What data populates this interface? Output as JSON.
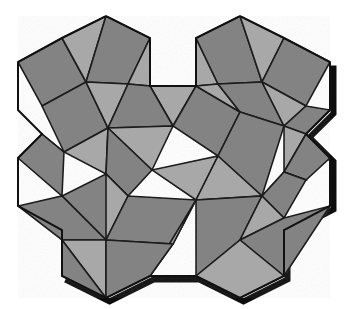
{
  "figure": {
    "artifact_glyph": "g",
    "canvas": {
      "width": 348,
      "height": 309
    }
  },
  "palette": {
    "background": "#ffffff",
    "dark_fill": "#838383",
    "light_fill": "#a8a8a8",
    "stroke": "#1c1c1c",
    "shadow": "#0d0d0d",
    "outline": "#111111"
  },
  "geometry": {
    "stroke_width": 1.6,
    "outline_width": 2.0,
    "shadow_width": 6.0,
    "silhouette": [
      [
        62,
        38
      ],
      [
        106,
        16
      ],
      [
        150,
        38
      ],
      [
        150,
        86
      ],
      [
        196,
        86
      ],
      [
        196,
        38
      ],
      [
        240,
        16
      ],
      [
        284,
        38
      ],
      [
        330,
        62
      ],
      [
        330,
        110
      ],
      [
        306,
        134
      ],
      [
        330,
        158
      ],
      [
        330,
        206
      ],
      [
        284,
        230
      ],
      [
        284,
        276
      ],
      [
        240,
        298
      ],
      [
        196,
        276
      ],
      [
        150,
        276
      ],
      [
        106,
        298
      ],
      [
        62,
        276
      ],
      [
        62,
        230
      ],
      [
        18,
        206
      ],
      [
        18,
        158
      ],
      [
        42,
        134
      ],
      [
        18,
        110
      ],
      [
        18,
        62
      ]
    ],
    "shadow_path": [
      [
        330,
        62
      ],
      [
        330,
        110
      ],
      [
        306,
        134
      ],
      [
        330,
        158
      ],
      [
        330,
        206
      ],
      [
        284,
        230
      ],
      [
        284,
        276
      ],
      [
        240,
        298
      ],
      [
        196,
        276
      ],
      [
        150,
        276
      ],
      [
        106,
        298
      ],
      [
        62,
        276
      ]
    ],
    "faces": [
      {
        "id": "sq-tl-outer",
        "kind": "square",
        "shade": "dark",
        "points": [
          [
            18,
            62
          ],
          [
            62,
            38
          ],
          [
            86,
            82
          ],
          [
            42,
            106
          ]
        ]
      },
      {
        "id": "tri-tl-top",
        "kind": "triangle",
        "shade": "light",
        "points": [
          [
            62,
            38
          ],
          [
            106,
            16
          ],
          [
            86,
            82
          ]
        ]
      },
      {
        "id": "sq-tl-top",
        "kind": "square",
        "shade": "dark",
        "points": [
          [
            106,
            16
          ],
          [
            150,
            38
          ],
          [
            128,
            84
          ],
          [
            86,
            82
          ]
        ]
      },
      {
        "id": "tri-tl-right",
        "kind": "triangle",
        "shade": "light",
        "points": [
          [
            150,
            38
          ],
          [
            150,
            86
          ],
          [
            128,
            84
          ]
        ]
      },
      {
        "id": "tri-top-notch",
        "kind": "triangle",
        "shade": "light",
        "points": [
          [
            150,
            86
          ],
          [
            196,
            86
          ],
          [
            173,
            126
          ]
        ]
      },
      {
        "id": "tri-tr-left",
        "kind": "triangle",
        "shade": "light",
        "points": [
          [
            196,
            86
          ],
          [
            196,
            38
          ],
          [
            218,
            84
          ]
        ]
      },
      {
        "id": "sq-tr-top",
        "kind": "square",
        "shade": "dark",
        "points": [
          [
            196,
            38
          ],
          [
            240,
            16
          ],
          [
            262,
            82
          ],
          [
            218,
            84
          ]
        ]
      },
      {
        "id": "tri-tr-top",
        "kind": "triangle",
        "shade": "light",
        "points": [
          [
            240,
            16
          ],
          [
            284,
            38
          ],
          [
            262,
            82
          ]
        ]
      },
      {
        "id": "sq-tr-outer",
        "kind": "square",
        "shade": "dark",
        "points": [
          [
            284,
            38
          ],
          [
            330,
            62
          ],
          [
            306,
            106
          ],
          [
            262,
            82
          ]
        ]
      },
      {
        "id": "sq-ml-left",
        "kind": "square",
        "shade": "dark",
        "points": [
          [
            42,
            106
          ],
          [
            86,
            82
          ],
          [
            108,
            128
          ],
          [
            64,
            152
          ]
        ]
      },
      {
        "id": "tri-ml-mid",
        "kind": "triangle",
        "shade": "light",
        "points": [
          [
            86,
            82
          ],
          [
            128,
            84
          ],
          [
            108,
            128
          ]
        ]
      },
      {
        "id": "sq-ml-right",
        "kind": "square",
        "shade": "dark",
        "points": [
          [
            128,
            84
          ],
          [
            150,
            86
          ],
          [
            173,
            126
          ],
          [
            108,
            128
          ]
        ]
      },
      {
        "id": "tri-mc-upper",
        "kind": "triangle",
        "shade": "light",
        "points": [
          [
            108,
            128
          ],
          [
            173,
            126
          ],
          [
            152,
            170
          ]
        ]
      },
      {
        "id": "sq-mc-right",
        "kind": "square",
        "shade": "dark",
        "points": [
          [
            173,
            126
          ],
          [
            196,
            86
          ],
          [
            240,
            112
          ],
          [
            218,
            156
          ]
        ]
      },
      {
        "id": "tri-mc-link",
        "kind": "triangle",
        "shade": "light",
        "points": [
          [
            196,
            86
          ],
          [
            218,
            84
          ],
          [
            240,
            112
          ]
        ]
      },
      {
        "id": "sq-mr-upper",
        "kind": "square",
        "shade": "dark",
        "points": [
          [
            218,
            84
          ],
          [
            262,
            82
          ],
          [
            284,
            126
          ],
          [
            240,
            112
          ]
        ]
      },
      {
        "id": "tri-mr-mid",
        "kind": "triangle",
        "shade": "light",
        "points": [
          [
            262,
            82
          ],
          [
            306,
            106
          ],
          [
            284,
            126
          ]
        ]
      },
      {
        "id": "sq-mr-right",
        "kind": "square",
        "shade": "dark",
        "points": [
          [
            306,
            106
          ],
          [
            330,
            110
          ],
          [
            306,
            134
          ],
          [
            284,
            126
          ]
        ]
      },
      {
        "id": "tri-mr-lower",
        "kind": "triangle",
        "shade": "light",
        "points": [
          [
            284,
            126
          ],
          [
            306,
            134
          ],
          [
            284,
            172
          ]
        ]
      },
      {
        "id": "sq-mr-outer",
        "kind": "square",
        "shade": "dark",
        "points": [
          [
            306,
            134
          ],
          [
            330,
            158
          ],
          [
            306,
            180
          ],
          [
            284,
            172
          ]
        ]
      },
      {
        "id": "sq-ml-lower",
        "kind": "square",
        "shade": "dark",
        "points": [
          [
            18,
            158
          ],
          [
            42,
            134
          ],
          [
            64,
            152
          ],
          [
            62,
            196
          ]
        ]
      },
      {
        "id": "tri-ml-low",
        "kind": "triangle",
        "shade": "light",
        "points": [
          [
            42,
            134
          ],
          [
            64,
            152
          ],
          [
            42,
            134
          ]
        ]
      },
      {
        "id": "tri-cl-left",
        "kind": "triangle",
        "shade": "light",
        "points": [
          [
            64,
            152
          ],
          [
            108,
            128
          ],
          [
            106,
            174
          ]
        ]
      },
      {
        "id": "sq-cl-mid",
        "kind": "square",
        "shade": "dark",
        "points": [
          [
            108,
            128
          ],
          [
            152,
            170
          ],
          [
            128,
            196
          ],
          [
            106,
            174
          ]
        ]
      },
      {
        "id": "tri-cc-left",
        "kind": "triangle",
        "shade": "light",
        "points": [
          [
            152,
            170
          ],
          [
            218,
            156
          ],
          [
            196,
            200
          ]
        ]
      },
      {
        "id": "sq-cc-right",
        "kind": "square",
        "shade": "dark",
        "points": [
          [
            218,
            156
          ],
          [
            240,
            112
          ],
          [
            284,
            126
          ],
          [
            262,
            196
          ]
        ]
      },
      {
        "id": "tri-cr-mid",
        "kind": "triangle",
        "shade": "light",
        "points": [
          [
            218,
            156
          ],
          [
            262,
            196
          ],
          [
            196,
            200
          ]
        ]
      },
      {
        "id": "tri-cr-right",
        "kind": "triangle",
        "shade": "light",
        "points": [
          [
            262,
            196
          ],
          [
            284,
            172
          ],
          [
            306,
            180
          ]
        ]
      },
      {
        "id": "sq-cr-outer",
        "kind": "square",
        "shade": "dark",
        "points": [
          [
            284,
            172
          ],
          [
            306,
            180
          ],
          [
            284,
            218
          ],
          [
            262,
            196
          ]
        ]
      },
      {
        "id": "sq-bl-left",
        "kind": "square",
        "shade": "dark",
        "points": [
          [
            62,
            196
          ],
          [
            106,
            174
          ],
          [
            128,
            196
          ],
          [
            106,
            240
          ]
        ]
      },
      {
        "id": "tri-bl-mid",
        "kind": "triangle",
        "shade": "light",
        "points": [
          [
            106,
            174
          ],
          [
            128,
            196
          ],
          [
            106,
            240
          ]
        ]
      },
      {
        "id": "sq-bl-lower",
        "kind": "square",
        "shade": "dark",
        "points": [
          [
            18,
            206
          ],
          [
            62,
            196
          ],
          [
            106,
            240
          ],
          [
            62,
            240
          ]
        ]
      },
      {
        "id": "sq-bc-left",
        "kind": "square",
        "shade": "dark",
        "points": [
          [
            128,
            196
          ],
          [
            196,
            200
          ],
          [
            173,
            244
          ],
          [
            106,
            240
          ]
        ]
      },
      {
        "id": "tri-bc-mid",
        "kind": "triangle",
        "shade": "light",
        "points": [
          [
            196,
            200
          ],
          [
            173,
            244
          ],
          [
            150,
            276
          ]
        ]
      },
      {
        "id": "sq-bc-right",
        "kind": "square",
        "shade": "dark",
        "points": [
          [
            196,
            200
          ],
          [
            262,
            196
          ],
          [
            240,
            240
          ],
          [
            196,
            276
          ]
        ]
      },
      {
        "id": "tri-br-mid",
        "kind": "triangle",
        "shade": "light",
        "points": [
          [
            262,
            196
          ],
          [
            284,
            218
          ],
          [
            240,
            240
          ]
        ]
      },
      {
        "id": "sq-br-outer",
        "kind": "square",
        "shade": "dark",
        "points": [
          [
            284,
            218
          ],
          [
            330,
            206
          ],
          [
            284,
            276
          ],
          [
            240,
            240
          ]
        ]
      },
      {
        "id": "tri-bl-bot",
        "kind": "triangle",
        "shade": "light",
        "points": [
          [
            62,
            240
          ],
          [
            106,
            240
          ],
          [
            106,
            298
          ]
        ]
      },
      {
        "id": "sq-bl-bot",
        "kind": "square",
        "shade": "dark",
        "points": [
          [
            62,
            240
          ],
          [
            106,
            298
          ],
          [
            62,
            276
          ]
        ]
      },
      {
        "id": "sq-bbl-bot",
        "kind": "square",
        "shade": "dark",
        "points": [
          [
            106,
            240
          ],
          [
            173,
            244
          ],
          [
            150,
            276
          ],
          [
            106,
            298
          ]
        ]
      },
      {
        "id": "tri-bbr-bot",
        "kind": "triangle",
        "shade": "light",
        "points": [
          [
            240,
            240
          ],
          [
            284,
            276
          ],
          [
            240,
            298
          ],
          [
            196,
            276
          ]
        ]
      }
    ]
  },
  "legend": {
    "dark_label": "square tile",
    "light_label": "triangle tile"
  }
}
